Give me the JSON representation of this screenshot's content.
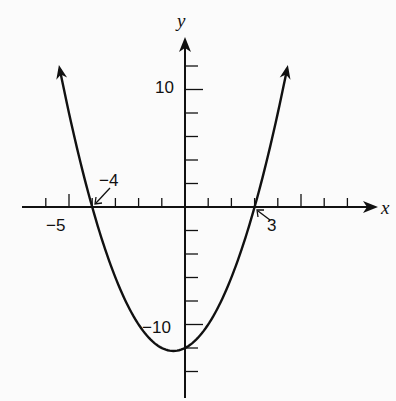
{
  "chart_data": {
    "type": "line",
    "title": "",
    "function": "y = x^2 + x - 12 = (x + 4)(x - 3)",
    "xlabel": "x",
    "ylabel": "y",
    "xlim": [
      -6.9,
      8.5
    ],
    "ylim": [
      -16.2,
      14.5
    ],
    "x_tick_step": 1,
    "y_tick_step": 2,
    "x_tick_labels": [
      {
        "value": -5,
        "label": "−5"
      }
    ],
    "y_tick_labels": [
      {
        "value": 10,
        "label": "10"
      },
      {
        "value": -10,
        "label": "−10"
      }
    ],
    "annotations": [
      {
        "text": "−4",
        "points_to": [
          -4,
          0
        ]
      },
      {
        "text": "3",
        "points_to": [
          3,
          0
        ]
      }
    ],
    "roots": [
      -4,
      3
    ],
    "y_intercept": -12,
    "vertex": [
      -0.5,
      -12.25
    ],
    "series": [
      {
        "name": "parabola",
        "x": [
          -5.4,
          -5,
          -4.5,
          -4,
          -3.5,
          -3,
          -2.5,
          -2,
          -1.5,
          -1,
          -0.5,
          0,
          0.5,
          1,
          1.5,
          2,
          2.5,
          3,
          3.5,
          4,
          4.4
        ],
        "values": [
          11.76,
          8,
          3.75,
          0,
          -3.25,
          -6,
          -8.25,
          -10,
          -11.25,
          -12,
          -12.25,
          -12,
          -11.25,
          -10,
          -8.25,
          -6,
          -3.75,
          0,
          3.75,
          8,
          11.76
        ]
      }
    ],
    "grid": false,
    "legend": null
  },
  "labels": {
    "x_axis": "x",
    "y_axis": "y",
    "x_minus5": "−5",
    "y_10": "10",
    "y_minus10": "−10",
    "root_left": "−4",
    "root_right": "3"
  }
}
